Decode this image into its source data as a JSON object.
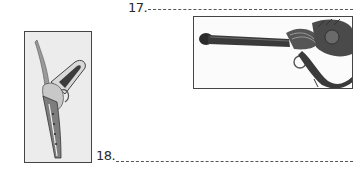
{
  "worksheet": {
    "questions": [
      {
        "number": "17.",
        "answer": ""
      },
      {
        "number": "18.",
        "answer": ""
      }
    ],
    "images": [
      {
        "name": "weapon-pistol-curved",
        "description": "ornate curved handgun (vertical)"
      },
      {
        "name": "weapon-long-rifle",
        "description": "long-barreled organic rifle with trigger ring"
      }
    ]
  },
  "colors": {
    "ink": "#2a2a2a",
    "frame": "#444444",
    "background": "#ffffff"
  }
}
